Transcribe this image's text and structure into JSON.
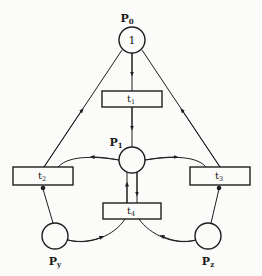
{
  "diagram": {
    "type": "petri-net",
    "colors": {
      "ink": "#1e1e1e",
      "background": "#fbfbf9"
    },
    "places": [
      {
        "id": "P0",
        "label": "P",
        "sub": "0",
        "tokens": "1"
      },
      {
        "id": "P1",
        "label": "P",
        "sub": "1",
        "tokens": ""
      },
      {
        "id": "Py",
        "label": "P",
        "sub": "y",
        "tokens": ""
      },
      {
        "id": "Pz",
        "label": "P",
        "sub": "z",
        "tokens": ""
      }
    ],
    "transitions": [
      {
        "id": "t1",
        "label": "t",
        "sub": "1"
      },
      {
        "id": "t2",
        "label": "t",
        "sub": "2"
      },
      {
        "id": "t3",
        "label": "t",
        "sub": "3"
      },
      {
        "id": "t4",
        "label": "t",
        "sub": "4"
      }
    ],
    "arcs": [
      {
        "from": "P0",
        "to": "t1",
        "kind": "normal"
      },
      {
        "from": "t1",
        "to": "P1",
        "kind": "normal"
      },
      {
        "from": "t2",
        "to": "P0",
        "kind": "normal"
      },
      {
        "from": "t3",
        "to": "P0",
        "kind": "normal"
      },
      {
        "from": "P1",
        "to": "t2",
        "kind": "normal"
      },
      {
        "from": "P1",
        "to": "t3",
        "kind": "normal"
      },
      {
        "from": "P1",
        "to": "t4",
        "kind": "normal"
      },
      {
        "from": "t4",
        "to": "P1",
        "kind": "normal"
      },
      {
        "from": "Py",
        "to": "t4",
        "kind": "normal"
      },
      {
        "from": "Pz",
        "to": "t4",
        "kind": "normal"
      },
      {
        "from": "Py",
        "to": "t2",
        "kind": "inhibitor"
      },
      {
        "from": "Pz",
        "to": "t3",
        "kind": "inhibitor"
      }
    ]
  }
}
